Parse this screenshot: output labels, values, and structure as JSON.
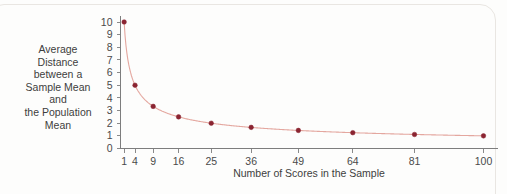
{
  "chart_data": {
    "type": "line",
    "title": "",
    "xlabel": "Number of Scores in the Sample",
    "ylabel": "Average Distance between a Sample Mean and the Population Mean",
    "x": [
      1,
      4,
      9,
      16,
      25,
      36,
      49,
      64,
      81,
      100
    ],
    "values": [
      10,
      5,
      3.33,
      2.5,
      2,
      1.67,
      1.43,
      1.25,
      1.11,
      1
    ],
    "xlim": [
      0,
      104
    ],
    "ylim": [
      0,
      10
    ],
    "x_tick_labels": [
      "1",
      "4",
      "9",
      "16",
      "25",
      "36",
      "49",
      "64",
      "81",
      "100"
    ],
    "y_tick_labels": [
      "0",
      "1",
      "2",
      "3",
      "4",
      "5",
      "6",
      "7",
      "8",
      "9",
      "10"
    ],
    "grid": false,
    "legend": "none",
    "marker_color": "#8b2431",
    "line_color": "#e4a79f",
    "axis_color": "#7d7d7d"
  },
  "y_axis_title_lines": [
    "Average",
    "Distance",
    "between a",
    "Sample Mean",
    "and",
    "the Population",
    "Mean"
  ]
}
